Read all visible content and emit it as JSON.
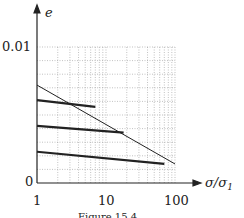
{
  "chart_data": {
    "type": "line",
    "title": "",
    "caption": "Figure 15.4 ...",
    "xlabel": "σ/σ₁",
    "ylabel": "e",
    "xscale": "log",
    "xlim": [
      1,
      100
    ],
    "ylim": [
      0,
      0.01
    ],
    "x_ticks": [
      "1",
      "10",
      "100"
    ],
    "y_ticks": [
      "0",
      "0.01"
    ],
    "grid": true,
    "series": [
      {
        "name": "limit line",
        "style": "thin",
        "x": [
          1,
          100
        ],
        "y": [
          0.0072,
          0.0014
        ]
      },
      {
        "name": "path 1",
        "style": "thick",
        "x": [
          1,
          7
        ],
        "y": [
          0.0061,
          0.0056
        ]
      },
      {
        "name": "path 2",
        "style": "thick",
        "x": [
          1,
          18
        ],
        "y": [
          0.0042,
          0.0037
        ]
      },
      {
        "name": "path 3",
        "style": "thick",
        "x": [
          1,
          70
        ],
        "y": [
          0.0023,
          0.0014
        ]
      }
    ]
  },
  "labels": {
    "y_axis": "e",
    "x_axis": "σ/σ",
    "x_axis_sub": "1",
    "y_top": "0.01",
    "y_zero": "0",
    "x1": "1",
    "x10": "10",
    "x100": "100",
    "caption": "Figure 15.4 ..."
  }
}
